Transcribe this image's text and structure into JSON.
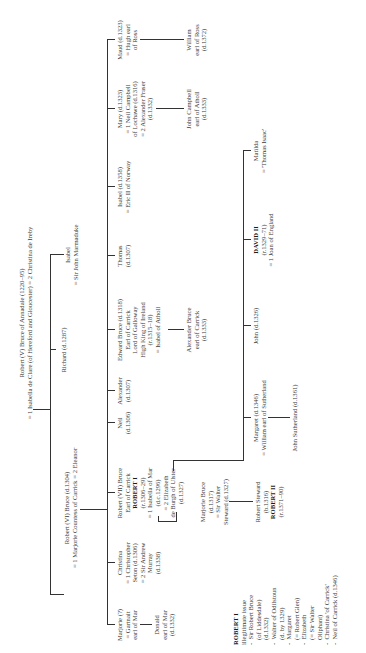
{
  "generation1": {
    "robert_v": {
      "lines": [
        "Robert (V) Bruce of Annadale (1220–95)",
        "= 1 Isabella de Clare (of Hereford and Gloucester)  = 2 Christina de Ireby"
      ]
    }
  },
  "generation2": {
    "robert_vi": {
      "lines": [
        "Robert (VI) Bruce (d.1304)",
        "= 1 Marjorie Countess of Carrick  = 2 Eleanor"
      ]
    },
    "richard": {
      "lines": [
        "Richard (d.1287)"
      ]
    },
    "isabel": {
      "lines": [
        "Isabel",
        "= Sir John Marmaduke"
      ]
    }
  },
  "generation3": {
    "marjorie": {
      "lines": [
        "Marjorie (?)",
        "= Gartnait",
        "earl of Mar"
      ]
    },
    "christina": {
      "lines": [
        "Christina",
        "= 1 Christopher",
        "Seton (d.1306)",
        "= 2 Sir Andrew",
        "Murray",
        "(d.1338)"
      ]
    },
    "robert_vii": {
      "lines": [
        "Robert (VII) Bruce",
        "Earl of Carrick"
      ],
      "title": "ROBERT I",
      "lines2": [
        "(r.1306–29)",
        "= 1 Isabella of Mar",
        "(d.c.1296)",
        "= 2 Elizabeth",
        "de Burgh of Ulster",
        "(d.1327)"
      ]
    },
    "neil": {
      "lines": [
        "Neil",
        "(d.1306)"
      ]
    },
    "alexander": {
      "lines": [
        "Alexander",
        "(d.1307)"
      ]
    },
    "edward": {
      "lines": [
        "Edward Bruce (d.1318)",
        "Earl of Carrick",
        "Lord of Galloway",
        "High King of Ireland",
        "(r.1315–18)",
        "= Isabel of Atholl"
      ]
    },
    "thomas": {
      "lines": [
        "Thomas",
        "(d.1307)"
      ]
    },
    "isabel": {
      "lines": [
        "Isabel (d.1358)",
        "= Eric II of Norway"
      ]
    },
    "mary": {
      "lines": [
        "Mary (d.1323)",
        "= 1 Neil Campbell",
        "of Lochawe (d.1316)",
        "= 2 Alexander Fraser",
        "(d.1332)"
      ]
    },
    "maud": {
      "lines": [
        "Maud (d.1323)",
        "= Hugh earl",
        "of Ross"
      ]
    }
  },
  "generation4": {
    "donald": {
      "lines": [
        "Donald",
        "earl of Mar",
        "(d.1332)"
      ]
    },
    "marjorie_bruce": {
      "lines": [
        "Marjorie Bruce",
        "(d.1317)",
        "= Sir Walter",
        "Steward (d.1327)"
      ]
    },
    "margaret": {
      "lines": [
        "Margaret (d.1346)",
        "= William earl of Sutherland"
      ]
    },
    "john": {
      "lines": [
        "John (d.1326)"
      ]
    },
    "david_ii": {
      "title": "DAVID II",
      "lines": [
        "(r.1329–71)",
        "= 1 Joan of England"
      ]
    },
    "matilda": {
      "lines": [
        "Matilda",
        "= 'Thomas Isaac'"
      ]
    },
    "alexander_bruce": {
      "lines": [
        "Alexander Bruce",
        "earl of Carrick",
        "(d.1333)"
      ]
    },
    "john_campbell": {
      "lines": [
        "John Campbell",
        "earl of Atholl",
        "(d.1333)"
      ]
    },
    "william_ross": {
      "lines": [
        "William",
        "earl of Ross",
        "(d.1372)"
      ]
    }
  },
  "generation5": {
    "robert_steward": {
      "lines": [
        "Robert Steward",
        "(b.1316)"
      ],
      "title": "ROBERT II",
      "lines2": [
        "(r.1371–90)"
      ]
    },
    "john_sutherland": {
      "lines": [
        "John Sutherland (d.1361)"
      ]
    }
  },
  "illegitimate": {
    "heading": "ROBERT I",
    "subheading": "illegitimate issue",
    "items": [
      [
        "Sir Robert Bruce",
        "(of Liddesdale)",
        "(d.1332)"
      ],
      [
        "Walter of Odilstoun",
        "(d. by 1329)"
      ],
      [
        "Margaret",
        "(= Robert Glen)"
      ],
      [
        "Elizabeth",
        "(= Sir Walter",
        "Oliphant)"
      ],
      [
        "Christina 'of Carrick'"
      ],
      [
        "Neil of Carrick (d.1346)"
      ]
    ],
    "bullet": "-"
  }
}
